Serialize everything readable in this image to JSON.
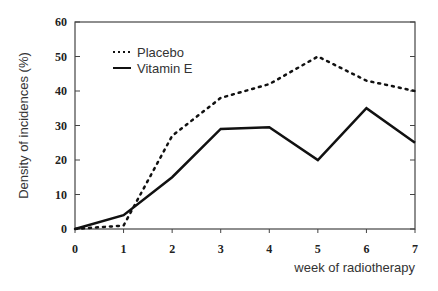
{
  "chart_data": {
    "type": "line",
    "title": "",
    "xlabel": "week of radiotherapy",
    "ylabel": "Density of incidences (%)",
    "x": [
      0,
      1,
      2,
      3,
      4,
      5,
      6,
      7
    ],
    "xlim": [
      0,
      7
    ],
    "ylim": [
      0,
      60
    ],
    "yticks": [
      0,
      10,
      20,
      30,
      40,
      50,
      60
    ],
    "xticks": [
      0,
      1,
      2,
      3,
      4,
      5,
      6,
      7
    ],
    "grid": false,
    "legend_position": "upper left",
    "series": [
      {
        "name": "Placebo",
        "style": "dotted",
        "values": [
          0,
          1,
          27,
          38,
          42,
          50,
          43,
          40
        ]
      },
      {
        "name": "Vitamin E",
        "style": "solid",
        "values": [
          0,
          4,
          15,
          29,
          29.5,
          20,
          35,
          25
        ]
      }
    ]
  }
}
